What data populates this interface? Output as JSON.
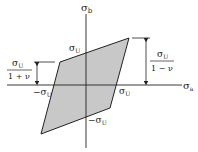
{
  "figure": {
    "axes": {
      "x_label": "σ",
      "x_sub": "a",
      "y_label": "σ",
      "y_sub": "b"
    },
    "labels": {
      "top_intercept": "σ",
      "top_intercept_sub": "U",
      "bottom_intercept": "−σ",
      "bottom_intercept_sub": "U",
      "left_intercept": "−σ",
      "left_intercept_sub": "U",
      "right_intercept": "σ",
      "right_intercept_sub": "U"
    },
    "dimensions": {
      "left_num": "σ",
      "left_num_sub": "U",
      "left_den": "1 + ν",
      "right_num": "σ",
      "right_num_sub": "U",
      "right_den": "1 − ν"
    },
    "colors": {
      "fill": "#c8c8c8",
      "stroke": "#222222"
    }
  }
}
